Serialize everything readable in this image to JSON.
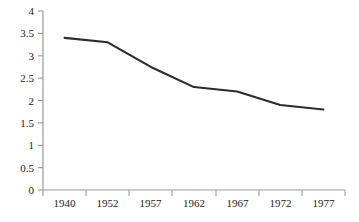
{
  "chart_data": {
    "type": "line",
    "title": "",
    "subtitle": "",
    "xlabel": "",
    "ylabel": "",
    "categories": [
      "1940",
      "1952",
      "1957",
      "1962",
      "1967",
      "1972",
      "1977"
    ],
    "values": [
      3.4,
      3.3,
      2.75,
      2.3,
      2.2,
      1.9,
      1.8
    ],
    "series": [
      {
        "name": "",
        "values": [
          3.4,
          3.3,
          2.75,
          2.3,
          2.2,
          1.9,
          1.8
        ]
      }
    ],
    "ylim": [
      0,
      4
    ],
    "ytick_labels": [
      "0",
      "0.5",
      "1",
      "1.5",
      "2",
      "2.5",
      "3",
      "3.5",
      "4"
    ],
    "ytick_values": [
      0,
      0.5,
      1,
      1.5,
      2,
      2.5,
      3,
      3.5,
      4
    ],
    "xtick_labels": [
      "1940",
      "1952",
      "1957",
      "1962",
      "1967",
      "1972",
      "1977"
    ],
    "grid": false,
    "legend": false,
    "legend_position": "none",
    "line_color": "#2b2b2b",
    "axis_color": "#9a9a9a",
    "background_color": "#ffffff",
    "text_color": "#222222"
  }
}
